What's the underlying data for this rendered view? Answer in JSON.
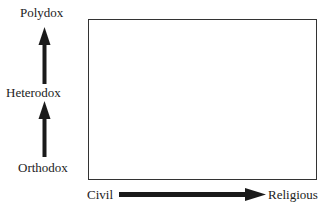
{
  "diagram": {
    "y_axis": {
      "labels": [
        "Polydox",
        "Heterodox",
        "Orthodox"
      ],
      "direction": "up"
    },
    "x_axis": {
      "start_label": "Civil",
      "end_label": "Religious",
      "direction": "right"
    },
    "colors": {
      "arrow": "#1a1a1a",
      "box_border": "#333333",
      "text": "#222222"
    }
  }
}
